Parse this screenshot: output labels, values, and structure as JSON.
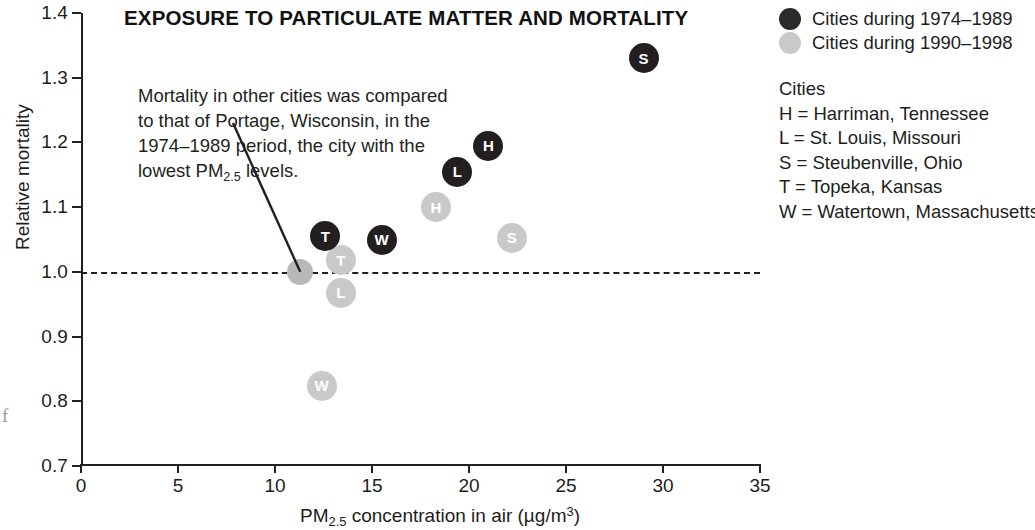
{
  "chart_data": {
    "type": "scatter",
    "title": "EXPOSURE TO PARTICULATE MATTER AND MORTALITY",
    "xlabel": "PM2.5 concentration in air (µg/m3)",
    "xlabel_parts": {
      "pre": "PM",
      "sub": "2.5",
      "post": " concentration in air (µg/m",
      "sup": "3",
      "tail": ")"
    },
    "ylabel": "Relative mortality",
    "xlim": [
      0,
      35
    ],
    "ylim": [
      0.7,
      1.4
    ],
    "xticks": [
      0,
      5,
      10,
      15,
      20,
      25,
      30,
      35
    ],
    "xtick_labels": [
      "0",
      "5",
      "10",
      "15",
      "20",
      "25",
      "30",
      "35"
    ],
    "yticks": [
      0.7,
      0.8,
      0.9,
      1.0,
      1.1,
      1.2,
      1.3,
      1.4
    ],
    "ytick_labels": [
      "0.7",
      "0.8",
      "0.9",
      "1.0",
      "1.1",
      "1.2",
      "1.3",
      "1.4"
    ],
    "grid": false,
    "reference_line": {
      "y": 1.0,
      "style": "dashed",
      "color": "#231f20"
    },
    "legend_position": "top-right",
    "series": [
      {
        "name": "Cities during 1974–1989",
        "color": "#231f20",
        "points": [
          {
            "label": "T",
            "city": "Topeka, Kansas",
            "x": 12.6,
            "y": 1.055
          },
          {
            "label": "W",
            "city": "Watertown, Massachusetts",
            "x": 15.5,
            "y": 1.05
          },
          {
            "label": "L",
            "city": "St. Louis, Missouri",
            "x": 19.4,
            "y": 1.155
          },
          {
            "label": "H",
            "city": "Harriman, Tennessee",
            "x": 21.0,
            "y": 1.195
          },
          {
            "label": "S",
            "city": "Steubenville, Ohio",
            "x": 29.0,
            "y": 1.33
          }
        ]
      },
      {
        "name": "Cities during 1990–1998",
        "color": "#c9c9c9",
        "points": [
          {
            "label": "",
            "city": "Portage, Wisconsin",
            "x": 11.3,
            "y": 1.0
          },
          {
            "label": "W",
            "city": "Watertown, Massachusetts",
            "x": 12.4,
            "y": 0.824
          },
          {
            "label": "T",
            "city": "Topeka, Kansas",
            "x": 13.4,
            "y": 1.018
          },
          {
            "label": "L",
            "city": "St. Louis, Missouri",
            "x": 13.4,
            "y": 0.968
          },
          {
            "label": "H",
            "city": "Harriman, Tennessee",
            "x": 18.3,
            "y": 1.1
          },
          {
            "label": "S",
            "city": "Steubenville, Ohio",
            "x": 22.2,
            "y": 1.053
          }
        ]
      }
    ],
    "annotation": {
      "lines": [
        "Mortality in other cities was compared",
        "to that of Portage, Wisconsin, in the",
        "1974–1989 period, the city with the"
      ],
      "last_line_pre": "lowest PM",
      "last_line_sub": "2.5",
      "last_line_post": " levels.",
      "points_to": {
        "x": 11.3,
        "y": 1.0
      }
    }
  },
  "legend": {
    "series_rows": [
      {
        "marker": "dark-circle-marker",
        "label": "Cities during 1974–1989"
      },
      {
        "marker": "light-circle-marker",
        "label": "Cities during 1990–1998"
      }
    ],
    "cities_heading": "Cities",
    "cities": [
      "H = Harriman, Tennessee",
      "L = St. Louis, Missouri",
      "S = Steubenville, Ohio",
      "T = Topeka, Kansas",
      "W = Watertown, Massachusetts"
    ]
  },
  "page_glyph": "f"
}
